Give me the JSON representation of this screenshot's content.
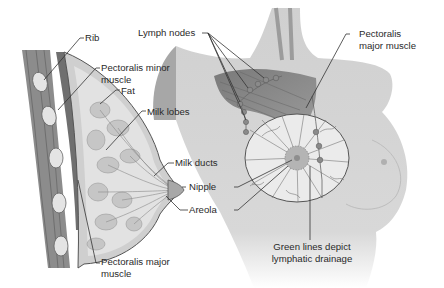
{
  "figure": {
    "left_panel": {
      "title": "Sagittal cross-section of breast",
      "labels": {
        "rib": "Rib",
        "pectoralis_minor_1": "Pectoralis minor",
        "pectoralis_minor_2": "muscle",
        "fat": "Fat",
        "milk_lobes": "Milk lobes",
        "milk_ducts": "Milk ducts",
        "nipple": "Nipple",
        "areola": "Areola",
        "pectoralis_major_1": "Pectoralis major",
        "pectoralis_major_2": "muscle"
      }
    },
    "right_panel": {
      "title": "Anterior view of chest with lymphatics",
      "labels": {
        "lymph_nodes": "Lymph nodes",
        "pectoralis_major_1": "Pectoralis",
        "pectoralis_major_2": "major muscle",
        "caption_1": "Green lines depict",
        "caption_2": "lymphatic drainage"
      }
    },
    "colors": {
      "background": "#ffffff",
      "text": "#2a2a2a",
      "leader_line": "#333333",
      "muscle": "#8a8a8a",
      "skin": "#d4d4d4",
      "fat": "#dcdcdc",
      "lobe": "#c4c4c4"
    }
  }
}
